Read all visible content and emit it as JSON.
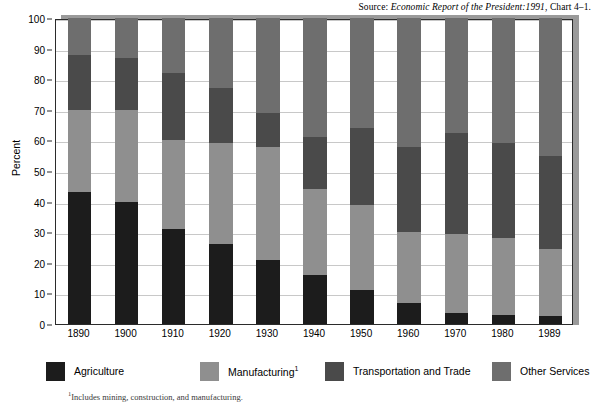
{
  "source_note": {
    "prefix": "Source: ",
    "italic": "Economic Report of the President:1991",
    "suffix": ", Chart 4–1."
  },
  "footnote": {
    "marker": "1",
    "text": "Includes mining, construction, and manufacturing."
  },
  "colors": {
    "agriculture": "#1c1c1c",
    "manufacturing": "#8f8f8f",
    "transportation": "#4a4a4a",
    "other_services": "#6e6e6e",
    "axis": "#2b2b2b",
    "grid": "#c8c8c8",
    "plot_background": "#ffffff",
    "shadow": "#9a9a9a"
  },
  "chart_data": {
    "type": "bar",
    "stacked": true,
    "title": "",
    "xlabel": "",
    "ylabel": "Percent",
    "ylim": [
      0,
      100
    ],
    "yticks": [
      0,
      10,
      20,
      30,
      40,
      50,
      60,
      70,
      80,
      90,
      100
    ],
    "grid": true,
    "legend_position": "bottom",
    "categories": [
      "1890",
      "1900",
      "1910",
      "1920",
      "1930",
      "1940",
      "1950",
      "1960",
      "1970",
      "1980",
      "1989"
    ],
    "series": [
      {
        "name": "Agriculture",
        "color_key": "agriculture",
        "values": [
          43,
          40,
          31,
          26,
          21,
          16,
          11,
          7,
          3.5,
          3,
          2.5
        ]
      },
      {
        "name": "Manufacturing",
        "footnote_marker": "1",
        "color_key": "manufacturing",
        "values": [
          27,
          30,
          29,
          33,
          37,
          28,
          28,
          23,
          26,
          25,
          22
        ]
      },
      {
        "name": "Transportation and Trade",
        "color_key": "transportation",
        "values": [
          18,
          17,
          22,
          18,
          11,
          17,
          25,
          28,
          33,
          31,
          30.5
        ]
      },
      {
        "name": "Other Services",
        "color_key": "other_services",
        "values": [
          12,
          13,
          18,
          23,
          31,
          39,
          36,
          42,
          37.5,
          41,
          45
        ]
      }
    ]
  }
}
